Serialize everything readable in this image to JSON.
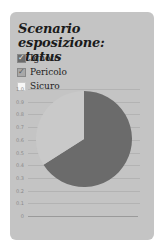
{
  "widget": {
    "title": "Scenario esposizione: status"
  },
  "legend": {
    "items": [
      {
        "label": "Ignoto",
        "checked": true,
        "color": "#6b6b6b"
      },
      {
        "label": "Pericolo",
        "checked": true,
        "color": "#a8a8a8"
      },
      {
        "label": "Sicuro",
        "checked": false,
        "color": "#f5f5f5"
      }
    ]
  },
  "axis": {
    "ticks": [
      "1.0",
      "0.9",
      "0.8",
      "0.7",
      "0.6",
      "0.5",
      "0.4",
      "0.3",
      "0.2",
      "0.1",
      "0"
    ]
  },
  "chart_data": {
    "type": "pie",
    "title": "Scenario esposizione: status",
    "categories": [
      "Ignoto",
      "Pericolo",
      "Sicuro"
    ],
    "values": [
      0.66,
      0.34,
      0
    ],
    "colors": [
      "#6b6b6b",
      "#c9c9c9",
      "#f5f5f5"
    ],
    "legend_position": "top-left",
    "ylim": [
      0,
      1.0
    ],
    "yticks": [
      1.0,
      0.9,
      0.8,
      0.7,
      0.6,
      0.5,
      0.4,
      0.3,
      0.2,
      0.1,
      0
    ],
    "grid": true
  }
}
